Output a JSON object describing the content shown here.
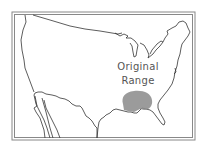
{
  "map": {
    "title": "",
    "region": "Contiguous United States",
    "annotation": {
      "line1": "Original",
      "line2": "Range"
    },
    "range_area": {
      "description": "Shaded original range over Gulf Coast states",
      "fill_color": "#8a8a8a"
    },
    "colors": {
      "background": "#ffffff",
      "frame": "#777777",
      "outline": "#333333",
      "label": "#555555"
    }
  }
}
